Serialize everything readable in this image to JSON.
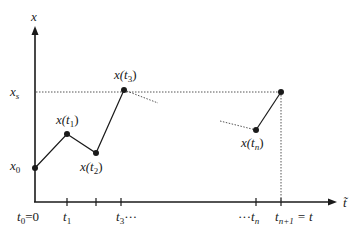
{
  "axes": {
    "y_label": "x",
    "x_label": "t̃"
  },
  "y_labels": {
    "xs": {
      "base": "x",
      "sub": "s"
    },
    "x0": {
      "base": "x",
      "sub": "0"
    }
  },
  "points": [
    {
      "name": "x0",
      "label": "x0",
      "cx": 35,
      "cy": 168
    },
    {
      "name": "x-t1",
      "label": "x(t1)",
      "cx": 67,
      "cy": 134
    },
    {
      "name": "x-t2",
      "label": "x(t2)",
      "cx": 96,
      "cy": 153
    },
    {
      "name": "x-t3",
      "label": "x(t3)",
      "cx": 124,
      "cy": 90
    },
    {
      "name": "x-tn",
      "label": "x(tn)",
      "cx": 256,
      "cy": 130
    },
    {
      "name": "x-tn1",
      "label": "xs",
      "cx": 281,
      "cy": 92
    }
  ],
  "point_labels": {
    "t1": {
      "pre": "x(t",
      "sub": "1",
      "post": ")"
    },
    "t2": {
      "pre": "x(t",
      "sub": "2",
      "post": ")"
    },
    "t3": {
      "pre": "x(t",
      "sub": "3",
      "post": ")"
    },
    "tn": {
      "pre": "x(t",
      "sub": "n",
      "post": ")"
    }
  },
  "ticks": {
    "t0": {
      "base": "t",
      "sub": "0",
      "post": "=0"
    },
    "t1": {
      "base": "t",
      "sub": "1"
    },
    "t3": {
      "base": "t",
      "sub": "3",
      "post": "···"
    },
    "tn": {
      "pre": "···",
      "base": "t",
      "sub": "n"
    },
    "tn1": {
      "base": "t",
      "sub": "n+1",
      "post": " = t"
    }
  },
  "colors": {
    "ink": "#1a1a1a",
    "dotted": "#555555"
  }
}
